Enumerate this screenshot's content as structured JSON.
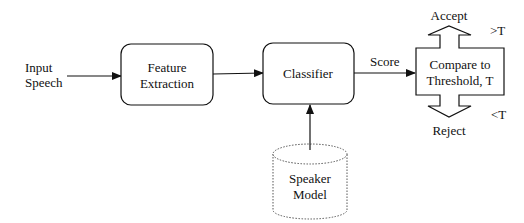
{
  "diagram": {
    "input": {
      "line1": "Input",
      "line2": "Speech"
    },
    "feature_extraction": {
      "line1": "Feature",
      "line2": "Extraction"
    },
    "classifier": {
      "label": "Classifier"
    },
    "score_label": "Score",
    "compare": {
      "line1": "Compare to",
      "line2": "Threshold, T"
    },
    "accept": {
      "label": "Accept",
      "condition": ">T"
    },
    "reject": {
      "label": "Reject",
      "condition": "<T"
    },
    "speaker_model": {
      "line1": "Speaker",
      "line2": "Model"
    },
    "colors": {
      "stroke": "#111111",
      "background": "#ffffff",
      "dotted": "#555555"
    }
  }
}
